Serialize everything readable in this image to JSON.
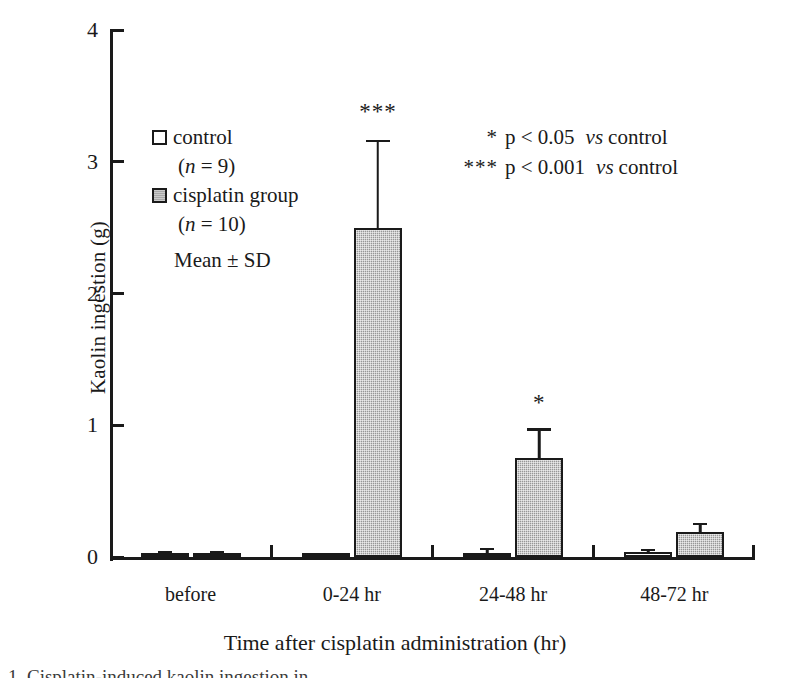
{
  "chart_data": {
    "type": "bar",
    "title": "",
    "xlabel": "Time after cisplatin administration (hr)",
    "ylabel": "Kaolin ingestion (g)",
    "categories": [
      "before",
      "0-24 hr",
      "24-48 hr",
      "48-72 hr"
    ],
    "ylim": [
      0,
      4
    ],
    "yticks": [
      0,
      1,
      2,
      3,
      4
    ],
    "ytick_labels": [
      "0",
      "1",
      "2",
      "3",
      "4"
    ],
    "grid": false,
    "legend_position": "inside-upper-left",
    "series": [
      {
        "name": "control",
        "n": 9,
        "color": "#ffffff",
        "edge_color": "#1a1a1a",
        "values": [
          0.02,
          0.0,
          0.03,
          0.035
        ],
        "errors": [
          0.01,
          0.0,
          0.02,
          0.01
        ]
      },
      {
        "name": "cisplatin group",
        "n": 10,
        "color": "#a8a8a8",
        "edge_color": "#1a1a1a",
        "values": [
          0.02,
          2.5,
          0.75,
          0.19
        ],
        "errors": [
          0.01,
          0.65,
          0.21,
          0.05
        ]
      }
    ],
    "annotations": [
      {
        "text": "***",
        "category": "0-24 hr",
        "series": "cisplatin group",
        "value": 3.3
      },
      {
        "text": "*",
        "category": "24-48 hr",
        "series": "cisplatin group",
        "value": 1.09
      }
    ],
    "notes": [
      "* p < 0.05  vs control",
      "*** p < 0.001 vs control",
      "Mean ± SD"
    ]
  },
  "legend": {
    "control_label": "control",
    "control_n": "(n = 9)",
    "control_n_italic": "n",
    "control_n_rest": " = 9)",
    "cisplatin_label": "cisplatin group",
    "cisplatin_n": "(n = 10)",
    "cisplatin_n_italic": "n",
    "cisplatin_n_rest": " = 10)",
    "mean_sd": "Mean ± SD"
  },
  "pnotes": [
    {
      "stars": "*",
      "text": "p < 0.05",
      "vs": "vs",
      "ref": "control"
    },
    {
      "stars": "***",
      "text": "p < 0.001",
      "vs": "vs",
      "ref": "control"
    }
  ],
  "axes": {
    "ylabel": "Kaolin ingestion (g)",
    "xlabel": "Time after cisplatin administration (hr)",
    "ytick_0": "0",
    "ytick_1": "1",
    "ytick_2": "2",
    "ytick_3": "3",
    "ytick_4": "4",
    "xtick_0": "before",
    "xtick_1": "0-24 hr",
    "xtick_2": "24-48 hr",
    "xtick_3": "48-72 hr"
  },
  "sig_marks": {
    "group_0_24": "***",
    "group_24_48": "*"
  },
  "caption": "1.  Cisplatin-induced kaolin ingestion in",
  "colors": {
    "control_fill": "#ffffff",
    "cisplatin_fill": "#a8a8a8",
    "ink": "#1a1a1a",
    "background": "#ffffff"
  }
}
